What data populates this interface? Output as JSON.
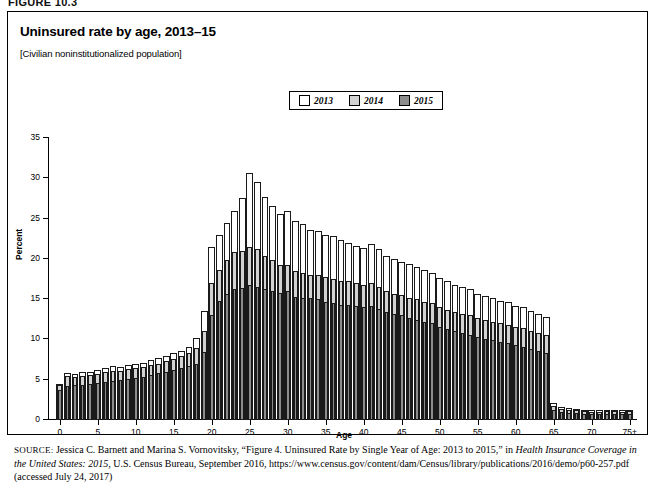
{
  "figure_tag": "FIGURE 10.3",
  "title": "Uninsured rate by age, 2013–15",
  "subtitle": "[Civilian noninstitutionalized population]",
  "legend": {
    "items": [
      {
        "label": "2013",
        "color": "#ffffff"
      },
      {
        "label": "2014",
        "color": "#d2d2d2"
      },
      {
        "label": "2015",
        "color": "#8c8c8c"
      }
    ]
  },
  "source": {
    "prefix": "SOURCE:",
    "text_1": " Jessica C. Barnett and Marina S. Vornovitsky, “Figure 4. Uninsured Rate by Single Year of Age: 2013 to 2015,” in ",
    "italic_1": "Health Insurance Coverage in the United States: 2015",
    "text_2": ", U.S. Census Bureau, September 2016, https://www.census.gov/content/dam/Census/library/publications/2016/demo/p60-257.pdf (accessed July 24, 2017)"
  },
  "chart_data": {
    "type": "bar",
    "title": "Uninsured rate by age, 2013–15",
    "subtitle": "[Civilian noninstitutionalized population]",
    "xlabel": "Age",
    "ylabel": "Percent",
    "ylim": [
      0,
      35
    ],
    "yticks": [
      0,
      5,
      10,
      15,
      20,
      25,
      30,
      35
    ],
    "xticks": [
      0,
      5,
      10,
      15,
      20,
      25,
      30,
      35,
      40,
      45,
      50,
      55,
      60,
      65,
      70,
      75
    ],
    "xticklabels": [
      "0",
      "5",
      "10",
      "15",
      "20",
      "25",
      "30",
      "35",
      "40",
      "45",
      "50",
      "55",
      "60",
      "65",
      "70",
      "75+"
    ],
    "grid": false,
    "legend_position": "top-center",
    "overlap_style": "overlapping-bars",
    "categories": [
      "0",
      "1",
      "2",
      "3",
      "4",
      "5",
      "6",
      "7",
      "8",
      "9",
      "10",
      "11",
      "12",
      "13",
      "14",
      "15",
      "16",
      "17",
      "18",
      "19",
      "20",
      "21",
      "22",
      "23",
      "24",
      "25",
      "26",
      "27",
      "28",
      "29",
      "30",
      "31",
      "32",
      "33",
      "34",
      "35",
      "36",
      "37",
      "38",
      "39",
      "40",
      "41",
      "42",
      "43",
      "44",
      "45",
      "46",
      "47",
      "48",
      "49",
      "50",
      "51",
      "52",
      "53",
      "54",
      "55",
      "56",
      "57",
      "58",
      "59",
      "60",
      "61",
      "62",
      "63",
      "64",
      "65",
      "66",
      "67",
      "68",
      "69",
      "70",
      "71",
      "72",
      "73",
      "74",
      "75+"
    ],
    "series": [
      {
        "name": "2013",
        "color": "#ffffff",
        "values": [
          4.5,
          5.8,
          5.7,
          5.9,
          6.0,
          6.2,
          6.4,
          6.7,
          6.6,
          6.8,
          6.9,
          7.1,
          7.4,
          7.7,
          8.0,
          8.3,
          8.6,
          9.1,
          10.2,
          13.5,
          21.5,
          23.0,
          24.5,
          26.0,
          27.5,
          30.6,
          29.6,
          27.7,
          26.6,
          25.6,
          26.0,
          24.7,
          24.3,
          23.6,
          23.5,
          23.0,
          22.8,
          22.4,
          22.0,
          21.6,
          21.3,
          21.8,
          21.2,
          20.3,
          20.0,
          19.6,
          19.4,
          19.0,
          18.6,
          18.3,
          17.6,
          17.2,
          16.8,
          16.5,
          16.2,
          15.7,
          15.4,
          15.1,
          14.8,
          14.6,
          14.2,
          14.0,
          13.5,
          13.2,
          12.8,
          2.1,
          1.6,
          1.5,
          1.4,
          1.3,
          1.2,
          1.2,
          1.3,
          1.3,
          1.2,
          1.3
        ]
      },
      {
        "name": "2014",
        "color": "#d2d2d2",
        "values": [
          4.3,
          5.5,
          5.4,
          5.5,
          5.6,
          5.7,
          5.9,
          6.1,
          6.1,
          6.3,
          6.4,
          6.6,
          6.8,
          7.0,
          7.3,
          7.6,
          7.9,
          8.3,
          9.0,
          11.0,
          17.0,
          18.6,
          19.9,
          20.8,
          21.0,
          21.5,
          21.2,
          20.3,
          19.8,
          19.3,
          19.3,
          18.5,
          18.3,
          18.0,
          18.0,
          17.8,
          17.5,
          17.3,
          17.3,
          17.0,
          16.8,
          17.0,
          16.5,
          16.0,
          15.7,
          15.5,
          15.2,
          15.0,
          14.7,
          14.5,
          14.0,
          13.7,
          13.4,
          13.2,
          13.0,
          12.6,
          12.4,
          12.2,
          12.0,
          11.8,
          11.6,
          11.4,
          11.0,
          10.8,
          10.5,
          1.8,
          1.4,
          1.3,
          1.2,
          1.1,
          1.0,
          1.0,
          1.1,
          1.1,
          1.0,
          1.1
        ]
      },
      {
        "name": "2015",
        "color": "#8c8c8c",
        "values": [
          3.7,
          4.2,
          4.3,
          4.4,
          4.5,
          4.6,
          4.7,
          4.9,
          5.0,
          5.1,
          5.2,
          5.4,
          5.6,
          5.8,
          6.0,
          6.2,
          6.4,
          6.7,
          7.0,
          8.5,
          13.0,
          14.8,
          15.6,
          16.2,
          16.4,
          16.8,
          16.5,
          16.2,
          16.0,
          15.8,
          16.0,
          15.3,
          15.2,
          15.1,
          15.0,
          14.7,
          14.5,
          14.3,
          14.3,
          14.2,
          14.0,
          14.2,
          13.8,
          13.4,
          13.2,
          13.0,
          12.7,
          12.4,
          12.2,
          12.0,
          11.6,
          11.3,
          11.0,
          10.8,
          10.6,
          10.3,
          10.1,
          9.9,
          9.7,
          9.5,
          9.3,
          9.1,
          8.8,
          8.6,
          8.3,
          1.3,
          1.0,
          0.9,
          0.9,
          0.8,
          0.8,
          0.8,
          0.8,
          0.8,
          0.8,
          0.8
        ]
      }
    ]
  }
}
